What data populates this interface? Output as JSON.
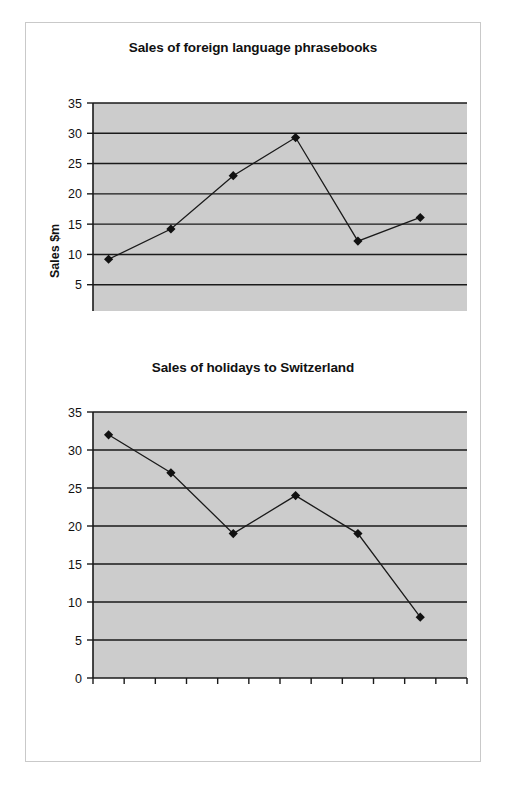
{
  "page": {
    "background_color": "#ffffff",
    "frame_color": "#c9c9c9"
  },
  "style": {
    "plot_background": "#cccccc",
    "gridline_color": "#1a1a1a",
    "series_color": "#1a1a1a",
    "marker_color": "#111111",
    "text_color": "#111111"
  },
  "chart_data": [
    {
      "type": "line",
      "title": "Sales of foreign language phrasebooks",
      "xlabel": "",
      "ylabel": "Sales $m",
      "categories": [
        "Jan",
        "Feb",
        "Mar",
        "Apr",
        "May",
        "Jun",
        "Jul",
        "Aug",
        "Sep",
        "Oct",
        "Nov",
        "Dec"
      ],
      "tick_labels": [
        "Jan",
        "Mar",
        "May",
        "Jul",
        "Sep",
        "Nov"
      ],
      "ytick_labels": [
        "0",
        "5",
        "10",
        "15",
        "20",
        "25",
        "30",
        "35"
      ],
      "yticks": [
        0,
        5,
        10,
        15,
        20,
        25,
        30,
        35
      ],
      "ylim": [
        0,
        35
      ],
      "grid": true,
      "legend": "none",
      "points": [
        {
          "x": "Jan",
          "y": 9.2
        },
        {
          "x": "Mar",
          "y": 14.2
        },
        {
          "x": "May",
          "y": 23.0
        },
        {
          "x": "Jul",
          "y": 29.3
        },
        {
          "x": "Sep",
          "y": 12.2
        },
        {
          "x": "Nov",
          "y": 16.1
        }
      ],
      "values": [
        9.2,
        14.2,
        23.0,
        29.3,
        12.2,
        16.1
      ]
    },
    {
      "type": "line",
      "title": "Sales of holidays to Switzerland",
      "xlabel": "",
      "ylabel": "Sales $m",
      "categories": [
        "Jan",
        "Feb",
        "Mar",
        "Apr",
        "May",
        "Jun",
        "Jul",
        "Aug",
        "Sep",
        "Oct",
        "Nov",
        "Dec"
      ],
      "tick_labels": [
        "Jan",
        "Mar",
        "May",
        "Jul",
        "Sep",
        "Nov"
      ],
      "ytick_labels": [
        "0",
        "5",
        "10",
        "15",
        "20",
        "25",
        "30",
        "35"
      ],
      "yticks": [
        0,
        5,
        10,
        15,
        20,
        25,
        30,
        35
      ],
      "ylim": [
        0,
        35
      ],
      "grid": true,
      "legend": "none",
      "points": [
        {
          "x": "Jan",
          "y": 32.0
        },
        {
          "x": "Mar",
          "y": 27.0
        },
        {
          "x": "May",
          "y": 19.0
        },
        {
          "x": "Jul",
          "y": 24.0
        },
        {
          "x": "Sep",
          "y": 19.0
        },
        {
          "x": "Nov",
          "y": 8.0
        }
      ],
      "values": [
        32.0,
        27.0,
        19.0,
        24.0,
        19.0,
        8.0
      ]
    }
  ]
}
